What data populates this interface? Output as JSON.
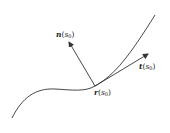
{
  "diagram": {
    "stroke_color": "#333333",
    "labels": {
      "normal": {
        "vec": "n",
        "open": "(",
        "arg": "s",
        "sub": "0",
        "close": ")"
      },
      "tangent": {
        "vec": "t",
        "open": "(",
        "arg": "s",
        "sub": "0",
        "close": ")"
      },
      "point": {
        "vec": "r",
        "open": "(",
        "arg": "s",
        "sub": "0",
        "close": ")"
      }
    }
  }
}
